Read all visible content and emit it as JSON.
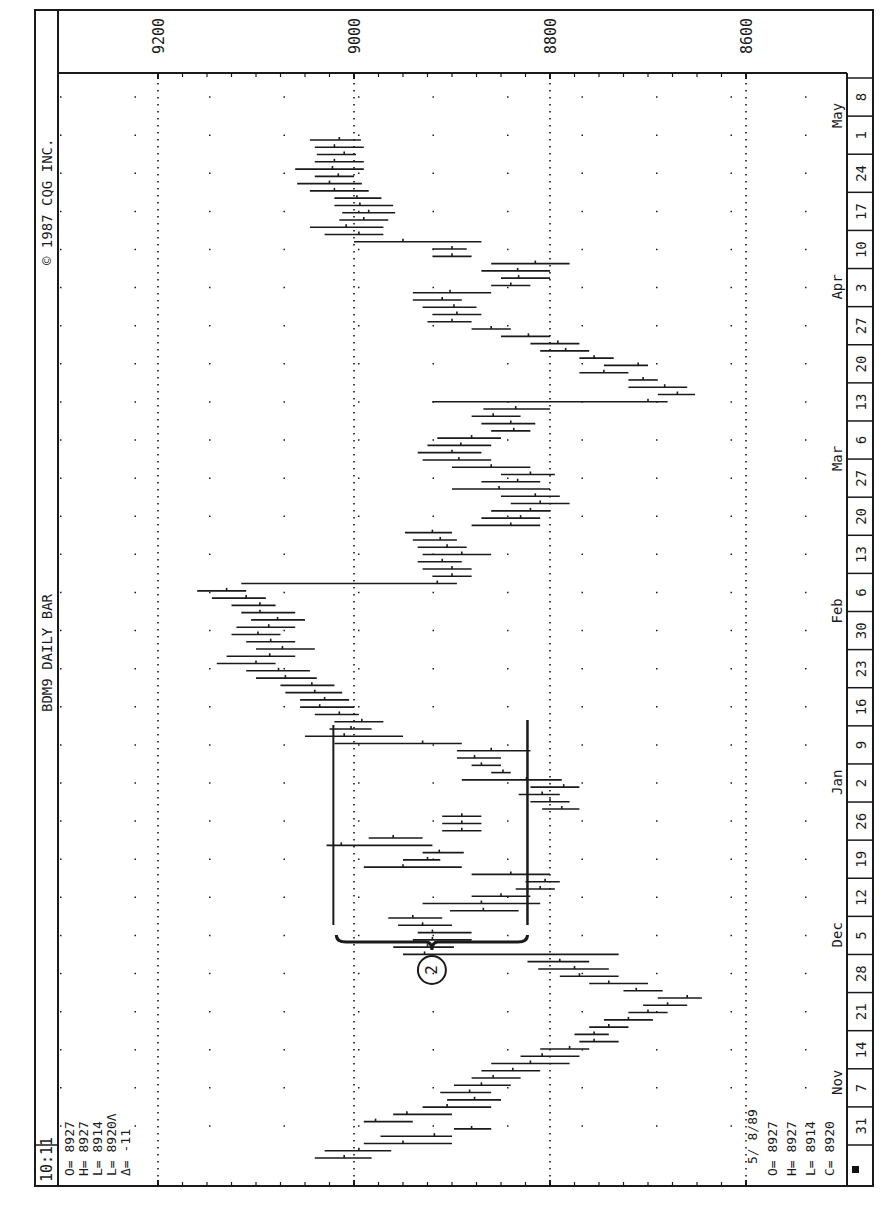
{
  "header": {
    "time": "10:11",
    "title": "BDM9 DAILY BAR",
    "copyright": "© 1987 CQG INC."
  },
  "last_bar_quote": {
    "lines": [
      "O= 8927",
      "H= 8927",
      "L= 8914",
      "L= 8920Λ",
      "Δ=  -11"
    ]
  },
  "cursor_quote": {
    "date": "5/ 8/89",
    "lines": [
      "O= 8927",
      "H= 8927",
      "L= 8914",
      "C= 8920"
    ]
  },
  "annotation": {
    "label": "2",
    "bracket_from_price": 9018,
    "bracket_to_price": 8823
  },
  "colors": {
    "ink": "#1a1a1a",
    "background": "#ffffff",
    "marker": "#111111"
  },
  "chart_data": {
    "type": "bar",
    "subtype": "ohlc-daily",
    "title": "BDM9 DAILY BAR",
    "orientation": "rotated 90deg counter-clockwise (time runs bottom-to-top, price runs right-to-left)",
    "xlabel": "Date (weekly ticks)",
    "ylabel": "Price",
    "ylim": [
      8600,
      9200
    ],
    "y_ticks": [
      9200,
      9000,
      8800,
      8600
    ],
    "grid": true,
    "month_labels": [
      "Nov",
      "Dec",
      "Jan",
      "Feb",
      "Mar",
      "Apr",
      "May"
    ],
    "week_ticks": [
      "31",
      "7",
      "14",
      "21",
      "28",
      "5",
      "12",
      "19",
      "26",
      "2",
      "9",
      "16",
      "23",
      "30",
      "6",
      "13",
      "20",
      "27",
      "6",
      "13",
      "20",
      "27",
      "3",
      "10",
      "17",
      "24",
      "1",
      "8"
    ],
    "bars": [
      {
        "h": 9040,
        "l": 8982,
        "c": 9010
      },
      {
        "h": 9030,
        "l": 8962,
        "c": 8995
      },
      {
        "h": 8990,
        "l": 8900,
        "c": 8950
      },
      {
        "h": 8973,
        "l": 8900,
        "c": 8918
      },
      {
        "h": 8898,
        "l": 8860,
        "c": 8880
      },
      {
        "h": 8990,
        "l": 8940,
        "c": 8978
      },
      {
        "h": 8960,
        "l": 8900,
        "c": 8946
      },
      {
        "h": 8930,
        "l": 8860,
        "c": 8905
      },
      {
        "h": 8905,
        "l": 8850,
        "c": 8877
      },
      {
        "h": 8912,
        "l": 8860,
        "c": 8882
      },
      {
        "h": 8898,
        "l": 8840,
        "c": 8870
      },
      {
        "h": 8880,
        "l": 8830,
        "c": 8858
      },
      {
        "h": 8870,
        "l": 8810,
        "c": 8838
      },
      {
        "h": 8860,
        "l": 8780,
        "c": 8820
      },
      {
        "h": 8830,
        "l": 8770,
        "c": 8808
      },
      {
        "h": 8810,
        "l": 8760,
        "c": 8780
      },
      {
        "h": 8770,
        "l": 8730,
        "c": 8755
      },
      {
        "h": 8775,
        "l": 8740,
        "c": 8755
      },
      {
        "h": 8760,
        "l": 8720,
        "c": 8740
      },
      {
        "h": 8745,
        "l": 8695,
        "c": 8720
      },
      {
        "h": 8720,
        "l": 8680,
        "c": 8700
      },
      {
        "h": 8705,
        "l": 8660,
        "c": 8680
      },
      {
        "h": 8690,
        "l": 8645,
        "c": 8660
      },
      {
        "h": 8725,
        "l": 8685,
        "c": 8712
      },
      {
        "h": 8760,
        "l": 8700,
        "c": 8740
      },
      {
        "h": 8790,
        "l": 8730,
        "c": 8770
      },
      {
        "h": 8812,
        "l": 8740,
        "c": 8775
      },
      {
        "h": 8823,
        "l": 8760,
        "c": 8790
      },
      {
        "h": 8950,
        "l": 8730,
        "c": 8928
      },
      {
        "h": 8960,
        "l": 8898,
        "c": 8925
      },
      {
        "h": 8940,
        "l": 8880,
        "c": 8920
      },
      {
        "h": 8935,
        "l": 8880,
        "c": 8920
      },
      {
        "h": 8955,
        "l": 8900,
        "c": 8930
      },
      {
        "h": 8965,
        "l": 8910,
        "c": 8940
      },
      {
        "h": 8902,
        "l": 8832,
        "c": 8868
      },
      {
        "h": 8930,
        "l": 8810,
        "c": 8870
      },
      {
        "h": 8880,
        "l": 8820,
        "c": 8850
      },
      {
        "h": 8835,
        "l": 8795,
        "c": 8810
      },
      {
        "h": 8825,
        "l": 8790,
        "c": 8805
      },
      {
        "h": 8880,
        "l": 8800,
        "c": 8840
      },
      {
        "h": 8990,
        "l": 8890,
        "c": 8950
      },
      {
        "h": 8950,
        "l": 8912,
        "c": 8925
      },
      {
        "h": 8930,
        "l": 8888,
        "c": 8913
      },
      {
        "h": 9028,
        "l": 8920,
        "c": 9013
      },
      {
        "h": 8985,
        "l": 8930,
        "c": 8960
      },
      {
        "h": 8910,
        "l": 8870,
        "c": 8890
      },
      {
        "h": 8910,
        "l": 8870,
        "c": 8890
      },
      {
        "h": 8910,
        "l": 8870,
        "c": 8890
      },
      {
        "h": 8808,
        "l": 8770,
        "c": 8788
      },
      {
        "h": 8820,
        "l": 8780,
        "c": 8800
      },
      {
        "h": 8832,
        "l": 8790,
        "c": 8808
      },
      {
        "h": 8820,
        "l": 8770,
        "c": 8786
      },
      {
        "h": 8890,
        "l": 8788,
        "c": 8824
      },
      {
        "h": 8860,
        "l": 8840,
        "c": 8848
      },
      {
        "h": 8880,
        "l": 8850,
        "c": 8870
      },
      {
        "h": 8895,
        "l": 8850,
        "c": 8877
      },
      {
        "h": 8895,
        "l": 8820,
        "c": 8860
      },
      {
        "h": 9020,
        "l": 8890,
        "c": 8930
      },
      {
        "h": 9050,
        "l": 8950,
        "c": 9010
      },
      {
        "h": 9025,
        "l": 8982,
        "c": 9003
      },
      {
        "h": 9020,
        "l": 8970,
        "c": 8992
      },
      {
        "h": 9040,
        "l": 8995,
        "c": 9015
      },
      {
        "h": 9055,
        "l": 9000,
        "c": 9035
      },
      {
        "h": 9055,
        "l": 9005,
        "c": 9030
      },
      {
        "h": 9070,
        "l": 9012,
        "c": 9040
      },
      {
        "h": 9075,
        "l": 9020,
        "c": 9043
      },
      {
        "h": 9100,
        "l": 9038,
        "c": 9070
      },
      {
        "h": 9110,
        "l": 9045,
        "c": 9077
      },
      {
        "h": 9140,
        "l": 9080,
        "c": 9100
      },
      {
        "h": 9130,
        "l": 9060,
        "c": 9086
      },
      {
        "h": 9100,
        "l": 9040,
        "c": 9073
      },
      {
        "h": 9110,
        "l": 9060,
        "c": 9085
      },
      {
        "h": 9125,
        "l": 9075,
        "c": 9098
      },
      {
        "h": 9120,
        "l": 9060,
        "c": 9087
      },
      {
        "h": 9105,
        "l": 9050,
        "c": 9078
      },
      {
        "h": 9115,
        "l": 9060,
        "c": 9096
      },
      {
        "h": 9125,
        "l": 9080,
        "c": 9096
      },
      {
        "h": 9145,
        "l": 9090,
        "c": 9110
      },
      {
        "h": 9160,
        "l": 9110,
        "c": 9130
      },
      {
        "h": 9115,
        "l": 8895,
        "c": 8915
      },
      {
        "h": 8920,
        "l": 8880,
        "c": 8900
      },
      {
        "h": 8930,
        "l": 8880,
        "c": 8900
      },
      {
        "h": 8935,
        "l": 8890,
        "c": 8910
      },
      {
        "h": 8930,
        "l": 8860,
        "c": 8890
      },
      {
        "h": 8935,
        "l": 8885,
        "c": 8905
      },
      {
        "h": 8940,
        "l": 8895,
        "c": 8912
      },
      {
        "h": 8948,
        "l": 8900,
        "c": 8920
      },
      {
        "h": 8880,
        "l": 8810,
        "c": 8840
      },
      {
        "h": 8870,
        "l": 8810,
        "c": 8830
      },
      {
        "h": 8860,
        "l": 8800,
        "c": 8820
      },
      {
        "h": 8840,
        "l": 8780,
        "c": 8810
      },
      {
        "h": 8850,
        "l": 8790,
        "c": 8815
      },
      {
        "h": 8900,
        "l": 8800,
        "c": 8852
      },
      {
        "h": 8870,
        "l": 8810,
        "c": 8833
      },
      {
        "h": 8850,
        "l": 8795,
        "c": 8820
      },
      {
        "h": 8900,
        "l": 8820,
        "c": 8860
      },
      {
        "h": 8930,
        "l": 8860,
        "c": 8893
      },
      {
        "h": 8935,
        "l": 8870,
        "c": 8900
      },
      {
        "h": 8925,
        "l": 8860,
        "c": 8891
      },
      {
        "h": 8915,
        "l": 8850,
        "c": 8880
      },
      {
        "h": 8860,
        "l": 8820,
        "c": 8837
      },
      {
        "h": 8870,
        "l": 8815,
        "c": 8840
      },
      {
        "h": 8880,
        "l": 8830,
        "c": 8858
      },
      {
        "h": 8868,
        "l": 8800,
        "c": 8835
      },
      {
        "h": 8920,
        "l": 8680,
        "c": 8700
      },
      {
        "h": 8690,
        "l": 8652,
        "c": 8670
      },
      {
        "h": 8720,
        "l": 8660,
        "c": 8683
      },
      {
        "h": 8720,
        "l": 8690,
        "c": 8705
      },
      {
        "h": 8770,
        "l": 8720,
        "c": 8745
      },
      {
        "h": 8745,
        "l": 8700,
        "c": 8710
      },
      {
        "h": 8770,
        "l": 8735,
        "c": 8755
      },
      {
        "h": 8810,
        "l": 8760,
        "c": 8784
      },
      {
        "h": 8820,
        "l": 8770,
        "c": 8792
      },
      {
        "h": 8850,
        "l": 8800,
        "c": 8822
      },
      {
        "h": 8880,
        "l": 8840,
        "c": 8860
      },
      {
        "h": 8925,
        "l": 8880,
        "c": 8900
      },
      {
        "h": 8920,
        "l": 8870,
        "c": 8895
      },
      {
        "h": 8930,
        "l": 8875,
        "c": 8898
      },
      {
        "h": 8940,
        "l": 8890,
        "c": 8910
      },
      {
        "h": 8940,
        "l": 8860,
        "c": 8902
      },
      {
        "h": 8860,
        "l": 8820,
        "c": 8840
      },
      {
        "h": 8850,
        "l": 8800,
        "c": 8832
      },
      {
        "h": 8870,
        "l": 8800,
        "c": 8833
      },
      {
        "h": 8860,
        "l": 8780,
        "c": 8815
      },
      {
        "h": 8920,
        "l": 8880,
        "c": 8900
      },
      {
        "h": 8920,
        "l": 8885,
        "c": 8900
      },
      {
        "h": 9000,
        "l": 8870,
        "c": 8950
      },
      {
        "h": 9030,
        "l": 8970,
        "c": 8995
      },
      {
        "h": 9045,
        "l": 8970,
        "c": 9008
      },
      {
        "h": 9015,
        "l": 8965,
        "c": 8990
      },
      {
        "h": 9012,
        "l": 8958,
        "c": 8985
      },
      {
        "h": 9020,
        "l": 8960,
        "c": 8994
      },
      {
        "h": 9020,
        "l": 8972,
        "c": 8997
      },
      {
        "h": 9045,
        "l": 8985,
        "c": 9020
      },
      {
        "h": 9058,
        "l": 8992,
        "c": 9025
      },
      {
        "h": 9040,
        "l": 9000,
        "c": 9016
      },
      {
        "h": 9060,
        "l": 8990,
        "c": 9022
      },
      {
        "h": 9040,
        "l": 8990,
        "c": 9020
      },
      {
        "h": 9038,
        "l": 8998,
        "c": 9010
      },
      {
        "h": 9040,
        "l": 8990,
        "c": 9020
      },
      {
        "h": 9045,
        "l": 8993,
        "c": 9015
      }
    ],
    "annotations": [
      {
        "type": "brace",
        "label": "2",
        "x_range": [
          "Dec 5",
          "Jan 13"
        ],
        "y_range": [
          8823,
          9018
        ]
      }
    ]
  }
}
